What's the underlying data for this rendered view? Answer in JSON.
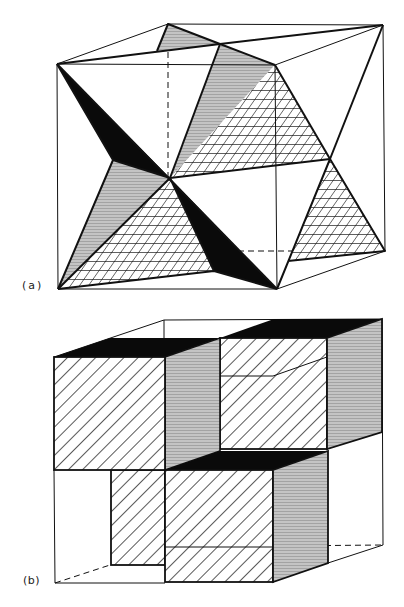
{
  "figure": {
    "panels": [
      {
        "id": "a",
        "label": "(a)",
        "description": "Cube containing interpenetrating tetrahedral/octahedral arrangement with black, grey-shaded and cross-hatched triangular faces"
      },
      {
        "id": "b",
        "label": "(b)",
        "description": "Cube subdivided into octants with four filled sub-cubes in alternating arrangement; faces shown black (top), diagonal hatched (front) and grey horizontal hatching (side)"
      }
    ],
    "colors": {
      "line": "#111111",
      "solid": "#0a0a0a",
      "grey": "#b9b9b9",
      "background": "#ffffff"
    }
  }
}
